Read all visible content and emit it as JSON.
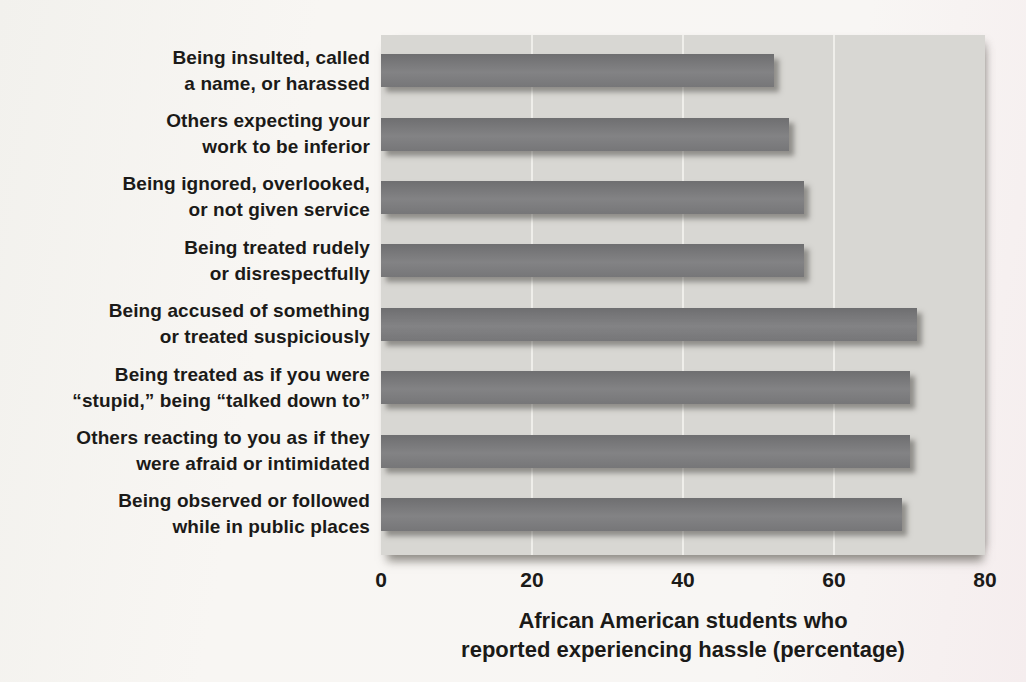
{
  "chart_data": {
    "type": "bar",
    "orientation": "horizontal",
    "title": "",
    "xlabel": "African American students who\nreported experiencing hassle (percentage)",
    "ylabel": "",
    "categories": [
      "Being insulted, called\na name, or harassed",
      "Others expecting your\nwork to be inferior",
      "Being ignored, overlooked,\nor not given service",
      "Being treated rudely\nor disrespectfully",
      "Being accused of something\nor treated suspiciously",
      "Being treated as if you were\n“stupid,” being “talked down to”",
      "Others reacting to you as if they\nwere afraid or intimidated",
      "Being observed or followed\nwhile in public places"
    ],
    "values": [
      52,
      54,
      56,
      56,
      71,
      70,
      70,
      69
    ],
    "xlim": [
      0,
      80
    ],
    "xticks": [
      0,
      20,
      40,
      60,
      80
    ],
    "grid": "vertical-white-gridlines",
    "legend": null,
    "colors": {
      "bar": "#7b7b7d",
      "plot_background": "#d8d7d3",
      "gridline": "#efeeea",
      "text": "#1b1a18",
      "page_background": "#f8f6f4"
    }
  }
}
